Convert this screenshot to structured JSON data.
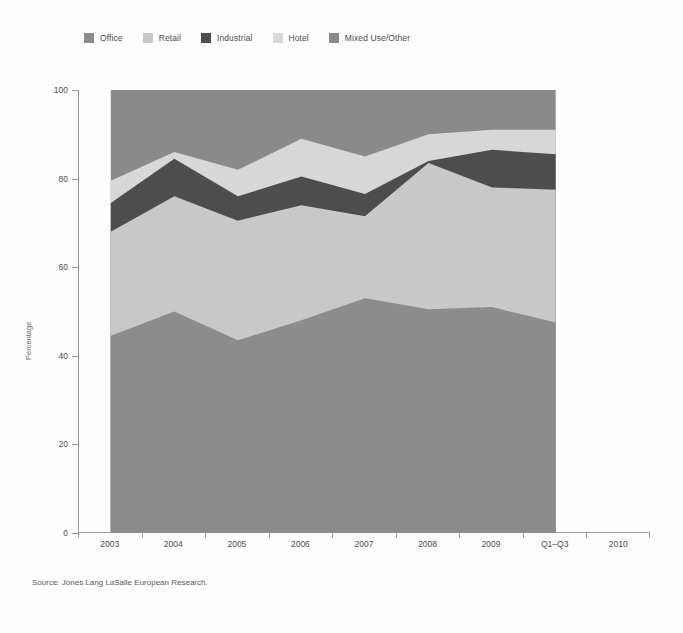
{
  "legend": {
    "items": [
      {
        "label": "Office",
        "color": "#8c8c8c"
      },
      {
        "label": "Retail",
        "color": "#c9c9c9"
      },
      {
        "label": "Industrial",
        "color": "#4d4d4d"
      },
      {
        "label": "Hotel",
        "color": "#d8d8d8"
      },
      {
        "label": "Mixed Use/Other",
        "color": "#8a8a8a"
      }
    ]
  },
  "source": {
    "text": "Source: Jones Lang LaSalle European Research."
  },
  "chart_data": {
    "type": "area",
    "stacked": true,
    "title": "",
    "subtitle": "",
    "xlabel": "",
    "ylabel": "Percentage",
    "ylim": [
      0,
      100
    ],
    "yticks": [
      0,
      20,
      40,
      60,
      80,
      100
    ],
    "grid": false,
    "legend_position": "top",
    "categories": [
      "2003",
      "2004",
      "2005",
      "2006",
      "2007",
      "2008",
      "2009",
      "Q1–Q3"
    ],
    "xtick_labels": [
      "2003",
      "2004",
      "2005",
      "2006",
      "2007",
      "2008",
      "2009",
      "Q1–Q3",
      "2010"
    ],
    "series": [
      {
        "name": "Office",
        "color": "#8c8c8c",
        "values": [
          44.5,
          50.0,
          43.5,
          48.0,
          53.0,
          50.5,
          51.0,
          47.5
        ]
      },
      {
        "name": "Retail",
        "color": "#c9c9c9",
        "values": [
          23.5,
          26.0,
          27.0,
          26.0,
          18.5,
          33.0,
          27.0,
          30.0
        ]
      },
      {
        "name": "Industrial",
        "color": "#4d4d4d",
        "values": [
          6.5,
          8.5,
          5.5,
          6.5,
          5.0,
          0.5,
          8.5,
          8.0
        ]
      },
      {
        "name": "Hotel",
        "color": "#d8d8d8",
        "values": [
          5.0,
          1.5,
          6.0,
          8.5,
          8.5,
          6.0,
          4.5,
          5.5
        ]
      },
      {
        "name": "Mixed Use/Other",
        "color": "#8a8a8a",
        "values": [
          20.5,
          14.0,
          18.0,
          11.0,
          15.0,
          10.0,
          9.0,
          9.0
        ]
      }
    ],
    "cumulative": [
      {
        "name": "Office",
        "values": [
          44.5,
          50.0,
          43.5,
          48.0,
          53.0,
          50.5,
          51.0,
          47.5
        ]
      },
      {
        "name": "Retail",
        "values": [
          68.0,
          76.0,
          70.5,
          74.0,
          71.5,
          83.5,
          78.0,
          77.5
        ]
      },
      {
        "name": "Industrial",
        "values": [
          74.5,
          84.5,
          76.0,
          80.5,
          76.5,
          84.0,
          86.5,
          85.5
        ]
      },
      {
        "name": "Hotel",
        "values": [
          79.5,
          86.0,
          82.0,
          89.0,
          85.0,
          90.0,
          91.0,
          91.0
        ]
      },
      {
        "name": "Mixed Use/Other",
        "values": [
          100,
          100,
          100,
          100,
          100,
          100,
          100,
          100
        ]
      }
    ]
  }
}
